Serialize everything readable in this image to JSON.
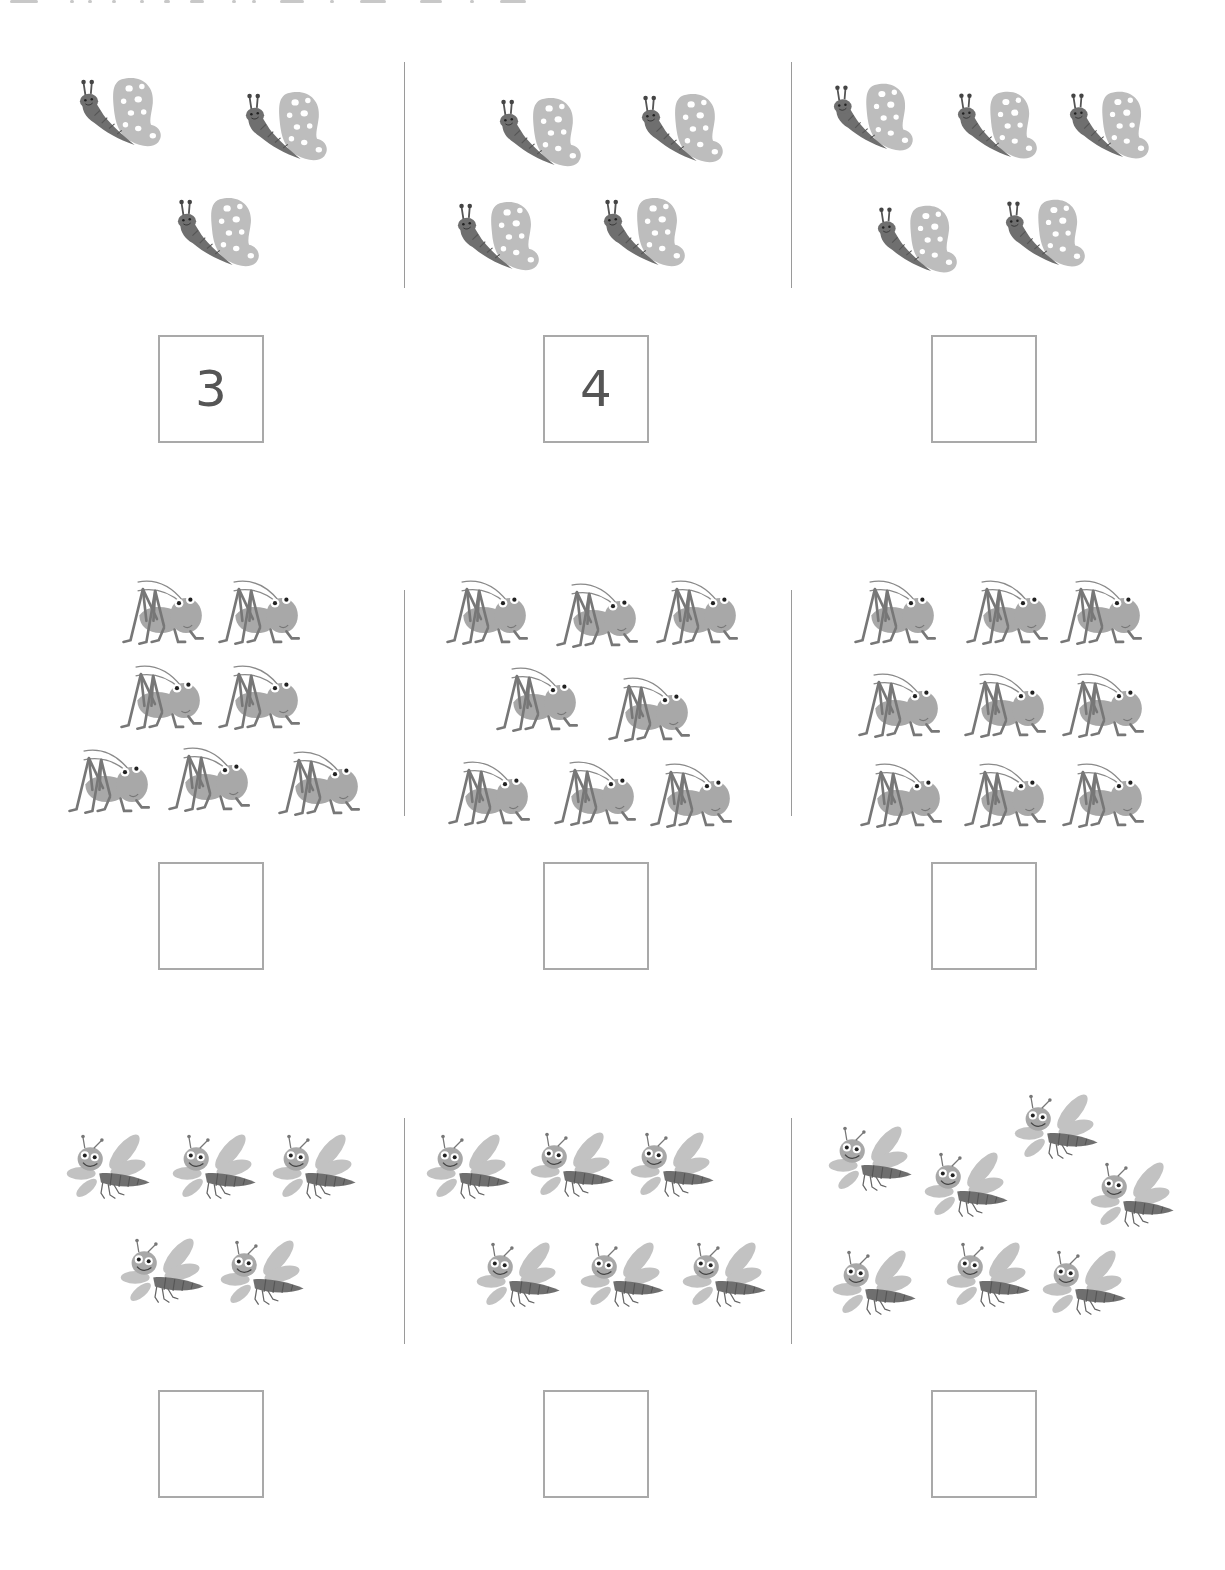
{
  "worksheet": {
    "instruction": "Count the insects and write the number in the box.",
    "colors": {
      "body": "#6f6f6f",
      "wing": "#bdbdbd",
      "box_border": "#a9a9a9",
      "digit": "#555555",
      "divider": "#9a9a9a"
    },
    "rows": [
      {
        "insect": "butterfly",
        "cells": [
          {
            "count": 3,
            "answer": "3"
          },
          {
            "count": 4,
            "answer": "4"
          },
          {
            "count": 5,
            "answer": ""
          }
        ]
      },
      {
        "insect": "grasshopper",
        "cells": [
          {
            "count": 7,
            "answer": ""
          },
          {
            "count": 8,
            "answer": ""
          },
          {
            "count": 9,
            "answer": ""
          }
        ]
      },
      {
        "insect": "dragonfly",
        "cells": [
          {
            "count": 5,
            "answer": ""
          },
          {
            "count": 6,
            "answer": ""
          },
          {
            "count": 7,
            "answer": ""
          }
        ]
      }
    ]
  }
}
